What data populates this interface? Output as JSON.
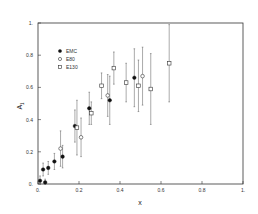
{
  "chart_data": {
    "type": "scatter",
    "title": "",
    "xlabel": "x",
    "ylabel": "A1",
    "xlim": [
      0,
      1
    ],
    "ylim": [
      0,
      1
    ],
    "grid": false,
    "legend_position": "upper-left",
    "x_ticks": [
      "0.",
      "0.2",
      "0.4",
      "0.6",
      "0.8",
      "1."
    ],
    "y_ticks": [
      "0.",
      "0.2",
      "0.4",
      "0.6",
      "0.8",
      "1."
    ],
    "series": [
      {
        "name": "EMC",
        "marker": "filled-circle",
        "points": [
          {
            "x": 0.01,
            "y": 0.02,
            "err": 0.03
          },
          {
            "x": 0.025,
            "y": 0.09,
            "err": 0.04
          },
          {
            "x": 0.035,
            "y": 0.01,
            "err": 0.02
          },
          {
            "x": 0.05,
            "y": 0.1,
            "err": 0.04
          },
          {
            "x": 0.08,
            "y": 0.14,
            "err": 0.05
          },
          {
            "x": 0.12,
            "y": 0.17,
            "err": 0.07
          },
          {
            "x": 0.18,
            "y": 0.36,
            "err": 0.1
          },
          {
            "x": 0.25,
            "y": 0.47,
            "err": 0.1
          },
          {
            "x": 0.35,
            "y": 0.52,
            "err": 0.15
          },
          {
            "x": 0.47,
            "y": 0.66,
            "err": 0.18
          }
        ]
      },
      {
        "name": "E80",
        "marker": "open-circle",
        "points": [
          {
            "x": 0.11,
            "y": 0.22,
            "err": 0.11
          },
          {
            "x": 0.21,
            "y": 0.29,
            "err": 0.12
          },
          {
            "x": 0.34,
            "y": 0.55,
            "err": 0.13
          },
          {
            "x": 0.51,
            "y": 0.67,
            "err": 0.18
          }
        ]
      },
      {
        "name": "E130",
        "marker": "open-square",
        "points": [
          {
            "x": 0.19,
            "y": 0.35,
            "err": 0.17
          },
          {
            "x": 0.26,
            "y": 0.44,
            "err": 0.07
          },
          {
            "x": 0.31,
            "y": 0.61,
            "err": 0.08
          },
          {
            "x": 0.37,
            "y": 0.72,
            "err": 0.1
          },
          {
            "x": 0.43,
            "y": 0.63,
            "err": 0.12
          },
          {
            "x": 0.49,
            "y": 0.61,
            "err": 0.16
          },
          {
            "x": 0.55,
            "y": 0.59,
            "err": 0.22
          },
          {
            "x": 0.64,
            "y": 0.75,
            "err": 0.24
          }
        ]
      }
    ]
  },
  "legend": {
    "items": [
      {
        "label": "EMC",
        "marker": "filled-circle"
      },
      {
        "label": "E80",
        "marker": "open-circle"
      },
      {
        "label": "E130",
        "marker": "open-square"
      }
    ]
  },
  "axes": {
    "xlabel": "x",
    "ylabel_main": "A",
    "ylabel_sub": "1"
  },
  "colors": {
    "ink": "#333333",
    "background": "#ffffff"
  }
}
